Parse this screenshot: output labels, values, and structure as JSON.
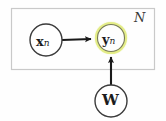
{
  "diagram": {
    "type": "plate-notation-graphical-model",
    "background_color": "#fefefe",
    "plate": {
      "label": "N",
      "border_color": "#c9c9c9",
      "x": 11,
      "y": 8,
      "width": 144,
      "height": 62
    },
    "nodes": [
      {
        "id": "xn",
        "variable": "x",
        "subscript": "n",
        "cx": 46,
        "cy": 40,
        "r": 16,
        "stroke": "#3b3b3b",
        "fill": "#ffffff",
        "highlighted": false,
        "inside_plate": true
      },
      {
        "id": "yn",
        "variable": "y",
        "subscript": "n",
        "cx": 111,
        "cy": 38,
        "r": 14,
        "stroke": "#4a4a4a",
        "fill": "#ffffff",
        "highlighted": true,
        "highlight_color": "#e9ef9a",
        "highlight_glow_color": "#f3f6cf",
        "inside_plate": true
      },
      {
        "id": "w",
        "variable": "W",
        "subscript": "",
        "cx": 111,
        "cy": 101,
        "r": 16,
        "stroke": "#3b3b3b",
        "fill": "#ffffff",
        "highlighted": false,
        "inside_plate": false
      }
    ],
    "edges": [
      {
        "id": "xn-to-yn",
        "from": "xn",
        "to": "yn",
        "orientation": "horizontal",
        "color": "#1a1a1a",
        "arrowhead": "filled-triangle"
      },
      {
        "id": "w-to-yn",
        "from": "w",
        "to": "yn",
        "orientation": "vertical",
        "color": "#1a1a1a",
        "arrowhead": "filled-triangle"
      }
    ]
  },
  "labels": {
    "xn_var": "x",
    "xn_sub": "n",
    "yn_var": "y",
    "yn_sub": "n",
    "w_var": "W",
    "plate_count": "N"
  }
}
